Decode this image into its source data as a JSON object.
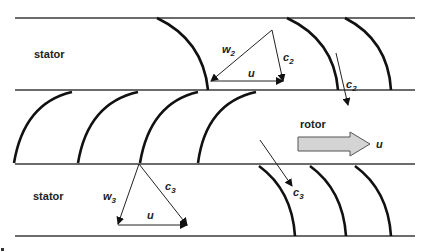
{
  "diagram": {
    "type": "turbine stage cascade with velocity triangles",
    "colors": {
      "line": "#3a3a3a",
      "blade": "#111111",
      "arrow": "#222222",
      "rotor_arrow_fill": "#d4d4d4",
      "rotor_arrow_stroke": "#555555"
    },
    "rows": [
      {
        "name": "stator",
        "label": "stator",
        "position": "top"
      },
      {
        "name": "rotor",
        "label": "rotor",
        "position": "middle"
      },
      {
        "name": "stator",
        "label": "stator",
        "position": "bottom"
      }
    ],
    "labels": {
      "stator_top": "stator",
      "rotor": "rotor",
      "stator_bottom": "stator",
      "rotor_speed": "u"
    },
    "velocity_triangles": [
      {
        "id": "outlet-stator",
        "vectors": [
          {
            "name": "w",
            "sub": "2"
          },
          {
            "name": "c",
            "sub": "2"
          },
          {
            "name": "u",
            "sub": ""
          }
        ]
      },
      {
        "id": "outlet-rotor",
        "vectors": [
          {
            "name": "w",
            "sub": "3"
          },
          {
            "name": "c",
            "sub": "3"
          },
          {
            "name": "u",
            "sub": ""
          }
        ]
      }
    ],
    "flow_arrows": [
      {
        "name": "c",
        "sub": "2"
      },
      {
        "name": "c",
        "sub": "3"
      }
    ],
    "text": {
      "w2": "w",
      "w2_sub": "2",
      "c2_tri": "c",
      "c2_tri_sub": "2",
      "u_top": "u",
      "c2_flow": "c",
      "c2_flow_sub": "2",
      "w3": "w",
      "w3_sub": "3",
      "c3_tri": "c",
      "c3_tri_sub": "3",
      "u_bottom": "u",
      "c3_flow": "c",
      "c3_flow_sub": "3"
    }
  }
}
